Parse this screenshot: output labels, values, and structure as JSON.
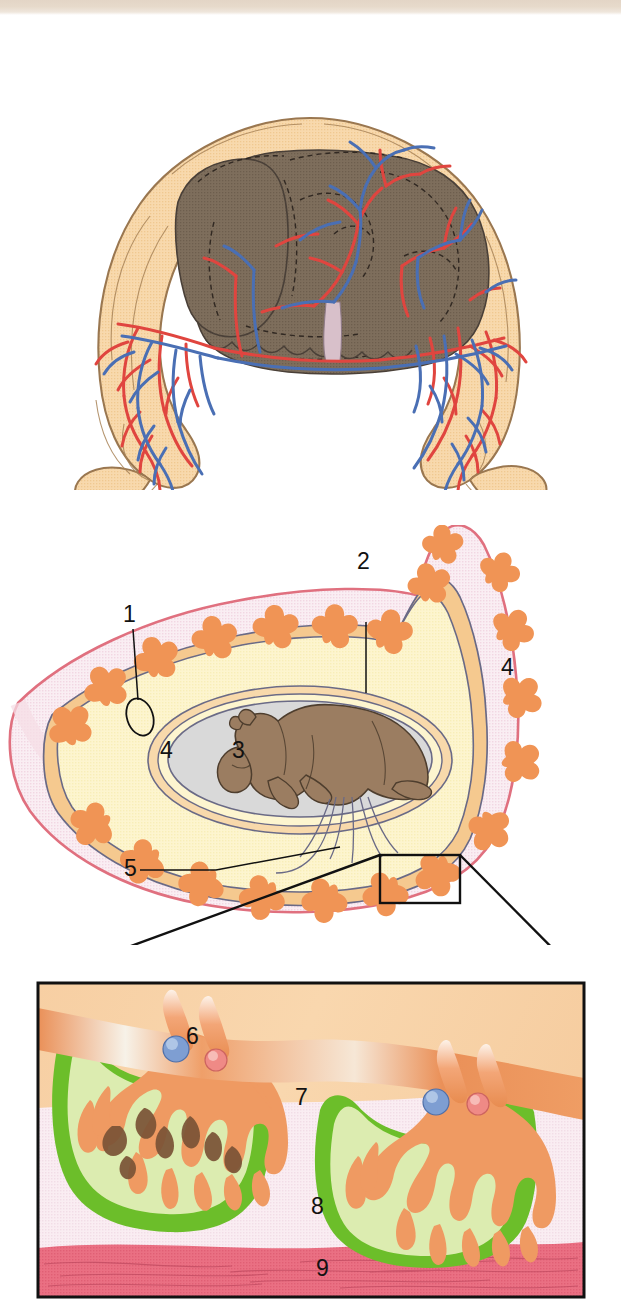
{
  "figure": {
    "panels": [
      {
        "id": "panel-top",
        "name": "gravid-bicornuate-uterus-vasculature"
      },
      {
        "id": "panel-middle",
        "name": "uterine-horn-cross-section"
      },
      {
        "id": "panel-detail",
        "name": "placentome-detail-inset"
      }
    ]
  },
  "colors": {
    "scan_band": "#e5d8c9",
    "uterus_tan": "#f6d6a8",
    "uterus_tan_outline": "#8a6a44",
    "fetus_brown_top": "#7a6a58",
    "fetus_brown_mid": "#9b7d61",
    "artery_red": "#e0453f",
    "vein_blue": "#4a6fb4",
    "uterine_wall_pink": "#f6dde6",
    "uterine_wall_edge": "#e0707f",
    "placentome_orange": "#f09455",
    "allantois_yellow": "#fbf2c8",
    "amnion_grey": "#d8d8d8",
    "chorion_line": "#5a5a78",
    "caruncle_green": "#6cbe2a",
    "caruncle_green_light": "#d7e9a8",
    "endometrium_pink": "#f7e7ee",
    "myometrium_red": "#e8697c",
    "cotyledon_orange": "#f0925c",
    "detail_bg_top": "#f6cfa4",
    "leader_black": "#111111"
  },
  "labels": {
    "middle_panel": [
      {
        "key": "1",
        "text": "1",
        "x": 123,
        "y": 614,
        "refers_to": "placentome-marker-ellipse"
      },
      {
        "key": "2",
        "text": "2",
        "x": 357,
        "y": 561,
        "refers_to": "uterine-wall-myometrium"
      },
      {
        "key": "3",
        "text": "3",
        "x": 232,
        "y": 750,
        "refers_to": "amniotic-cavity"
      },
      {
        "key": "4a",
        "text": "4",
        "x": 160,
        "y": 750,
        "refers_to": "allantoic-cavity-left"
      },
      {
        "key": "4b",
        "text": "4",
        "x": 501,
        "y": 667,
        "refers_to": "allantoic-cavity-right"
      },
      {
        "key": "5",
        "text": "5",
        "x": 124,
        "y": 868,
        "refers_to": "allantochorion-umbilicus"
      }
    ],
    "detail_panel": [
      {
        "key": "6",
        "text": "6",
        "x": 186,
        "y": 1036,
        "refers_to": "umbilical-vessels-artery-vein"
      },
      {
        "key": "7",
        "text": "7",
        "x": 295,
        "y": 1097,
        "refers_to": "caruncle-maternal"
      },
      {
        "key": "8",
        "text": "8",
        "x": 311,
        "y": 1206,
        "refers_to": "endometrium"
      },
      {
        "key": "9",
        "text": "9",
        "x": 316,
        "y": 1268,
        "refers_to": "myometrium"
      }
    ]
  },
  "legend_numbers": [
    "1",
    "2",
    "3",
    "4",
    "5",
    "6",
    "7",
    "8",
    "9"
  ]
}
